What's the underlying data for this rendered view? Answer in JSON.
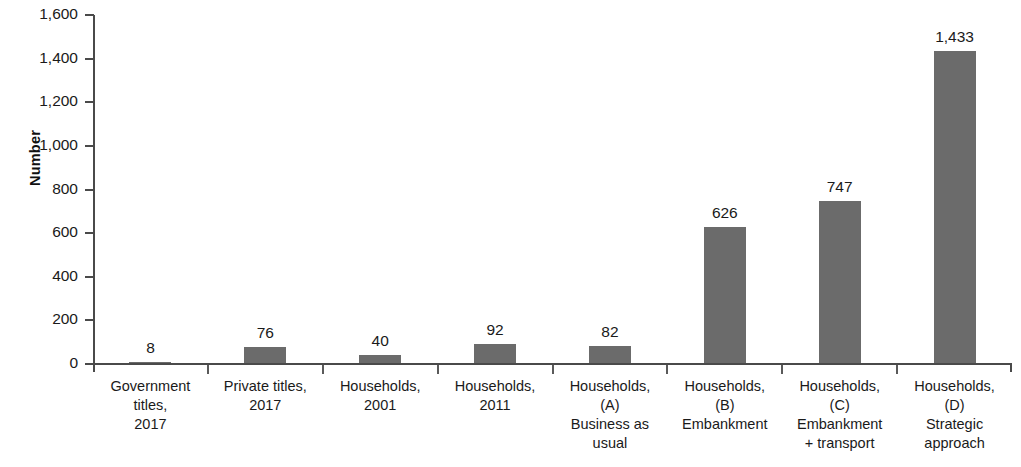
{
  "chart_data": {
    "type": "bar",
    "title": "",
    "subtitle": "",
    "xlabel": "",
    "ylabel": "Number",
    "ylim": [
      0,
      1600
    ],
    "ytick_step": 200,
    "grid": false,
    "legend": null,
    "bar_color": "#6b6b6b",
    "axis_color": "#4a4a4a",
    "text_color": "#1a1a1a",
    "categories": [
      "Government titles, 2017",
      "Private titles, 2017",
      "Households, 2001",
      "Households, 2011",
      "Households, (A) Business as usual",
      "Households, (B) Embankment",
      "Households, (C) Embankment + transport",
      "Households, (D) Strategic approach"
    ],
    "category_lines": [
      [
        "Government",
        "titles,",
        "2017"
      ],
      [
        "Private titles,",
        "2017"
      ],
      [
        "Households,",
        "2001"
      ],
      [
        "Households,",
        "2011"
      ],
      [
        "Households,",
        "(A)",
        "Business as",
        "usual"
      ],
      [
        "Households,",
        "(B)",
        "Embankment"
      ],
      [
        "Households,",
        "(C)",
        "Embankment",
        "+ transport"
      ],
      [
        "Households,",
        "(D)",
        "Strategic",
        "approach"
      ]
    ],
    "values": [
      8,
      76,
      40,
      92,
      82,
      626,
      747,
      1433
    ],
    "value_labels": [
      "8",
      "76",
      "40",
      "92",
      "82",
      "626",
      "747",
      "1,433"
    ],
    "ytick_values": [
      0,
      200,
      400,
      600,
      800,
      1000,
      1200,
      1400,
      1600
    ],
    "ytick_labels": [
      "0",
      "200",
      "400",
      "600",
      "800",
      "1,000",
      "1,200",
      "1,400",
      "1,600"
    ]
  }
}
